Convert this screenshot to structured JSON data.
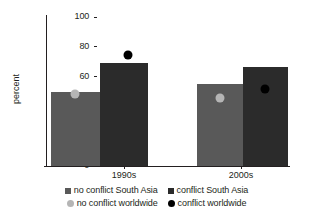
{
  "chart_data": {
    "type": "bar",
    "title": "",
    "xlabel": "",
    "ylabel": "percent",
    "ylim": [
      0,
      100
    ],
    "yticks": [
      0,
      20,
      40,
      60,
      80,
      100
    ],
    "ytick_labels": [
      "0",
      "20",
      "40",
      "60",
      "80",
      "100"
    ],
    "grid": false,
    "legend_position": "bottom",
    "categories": [
      "1990s",
      "2000s"
    ],
    "series": [
      {
        "name": "no conflict South Asia",
        "type": "bar",
        "marker": "square",
        "color": "#595959",
        "values": [
          50,
          55
        ]
      },
      {
        "name": "conflict South Asia",
        "type": "bar",
        "marker": "square",
        "color": "#2b2b2b",
        "values": [
          69,
          66.5
        ]
      },
      {
        "name": "no conflict worldwide",
        "type": "point",
        "marker": "circle",
        "color": "#b5b5b5",
        "values": [
          48,
          45.5
        ]
      },
      {
        "name": "conflict worldwide",
        "type": "point",
        "marker": "circle",
        "color": "#000000",
        "values": [
          74.5,
          52
        ]
      }
    ]
  },
  "axis": {
    "y_title": "percent",
    "y_tick_labels": [
      "100",
      "80",
      "60",
      "40",
      "20",
      "0"
    ],
    "x_tick_labels": [
      "1990s",
      "2000s"
    ]
  },
  "legend": {
    "rows": [
      [
        {
          "label": "no conflict South Asia",
          "marker": "square",
          "color": "#595959"
        },
        {
          "label": "conflict South Asia",
          "marker": "square",
          "color": "#2b2b2b"
        }
      ],
      [
        {
          "label": "no conflict worldwide",
          "marker": "circle",
          "color": "#b5b5b5"
        },
        {
          "label": "conflict worldwide",
          "marker": "circle",
          "color": "#000000"
        }
      ]
    ]
  }
}
